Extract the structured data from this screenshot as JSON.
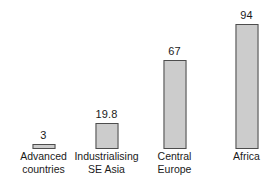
{
  "chart_data": {
    "type": "bar",
    "title": "",
    "subtitle": "",
    "xlabel": "",
    "ylabel": "",
    "ylim": [
      0,
      100
    ],
    "grid": false,
    "legend": "none",
    "orientation": "vertical",
    "categories": [
      "Advanced countries",
      "Industrialising SE Asia",
      "Central Europe",
      "Africa"
    ],
    "category_lines": [
      [
        "Advanced",
        "countries"
      ],
      [
        "Industrialising",
        "SE Asia"
      ],
      [
        "Central",
        "Europe"
      ],
      [
        "Africa"
      ]
    ],
    "values": [
      3,
      19.8,
      67,
      94
    ],
    "value_labels": [
      "3",
      "19.8",
      "67",
      "94"
    ],
    "tick_labels": [],
    "annotations": [],
    "colors": {
      "bar_fill": "#cccccc",
      "bar_border": "#4d4d4d",
      "background": "#ffffff",
      "text": "#1a1a1a"
    }
  }
}
